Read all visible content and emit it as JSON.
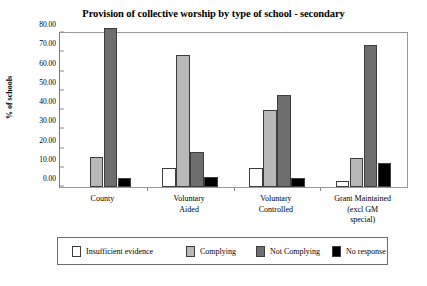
{
  "chart_data": {
    "type": "bar",
    "title": "Provision of collective worship by type of school - secondary",
    "xlabel": "",
    "ylabel": "% of schools",
    "ylim": [
      0,
      80
    ],
    "ytick_labels": [
      "0.00",
      "10.00",
      "20.00",
      "30.00",
      "40.00",
      "50.00",
      "60.00",
      "70.00",
      "80.00"
    ],
    "ytick_values": [
      0,
      10,
      20,
      30,
      40,
      50,
      60,
      70,
      80
    ],
    "grid": false,
    "legend_position": "bottom",
    "categories": [
      "County",
      "Voluntary\nAided",
      "Voluntary\nControlled",
      "Grant Maintained\n(excl GM\nspecial)"
    ],
    "category_lines": [
      [
        "County"
      ],
      [
        "Voluntary",
        "Aided"
      ],
      [
        "Voluntary",
        "Controlled"
      ],
      [
        "Grant Maintained",
        "(excl GM",
        "special)"
      ]
    ],
    "series": [
      {
        "name": "Insufficient evidence",
        "color": "#ffffff",
        "values": [
          0,
          9.8,
          9.8,
          3.0
        ]
      },
      {
        "name": "Complying",
        "color": "#b8b8b8",
        "values": [
          15.5,
          68.5,
          40.0,
          15.0
        ]
      },
      {
        "name": "Not Complying",
        "color": "#6e6e6e",
        "values": [
          82.5,
          18.0,
          48.0,
          74.0
        ]
      },
      {
        "name": "No response",
        "color": "#000000",
        "values": [
          4.8,
          5.0,
          4.5,
          12.5
        ]
      }
    ]
  },
  "legend": {
    "items": [
      {
        "label": "Insufficient evidence",
        "color": "#ffffff"
      },
      {
        "label": "Complying",
        "color": "#b8b8b8"
      },
      {
        "label": "Not Complying",
        "color": "#6e6e6e"
      },
      {
        "label": "No response",
        "color": "#000000"
      }
    ]
  }
}
